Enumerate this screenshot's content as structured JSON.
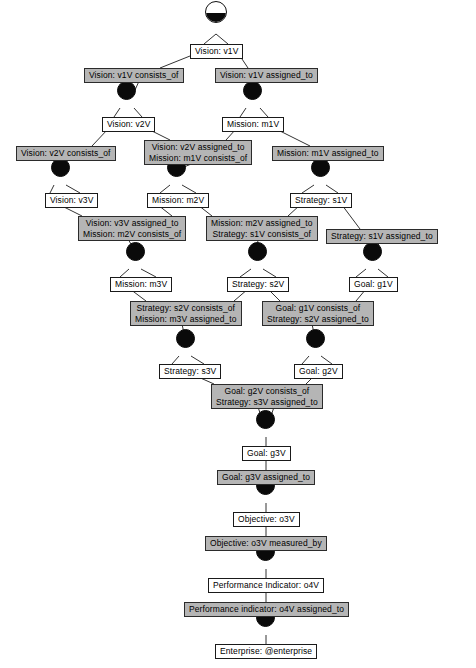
{
  "diagram": {
    "type": "tree",
    "colors": {
      "background": "#ffffff",
      "node_fill": "#0a0a0a",
      "node_label_fill": "#ffffff",
      "arc_label_fill": "#b5b5b5",
      "border": "#1a1a1a",
      "edge": "#333333"
    },
    "vertices": [
      {
        "id": "r0",
        "kind": "root",
        "x": 216,
        "y": 12,
        "d": 22
      },
      {
        "id": "v1",
        "kind": "filled",
        "x": 126,
        "y": 90,
        "d": 19
      },
      {
        "id": "v2",
        "kind": "filled",
        "x": 252,
        "y": 90,
        "d": 19
      },
      {
        "id": "v3",
        "kind": "filled",
        "x": 60,
        "y": 167,
        "d": 19
      },
      {
        "id": "v4",
        "kind": "filled",
        "x": 176,
        "y": 167,
        "d": 19
      },
      {
        "id": "v5",
        "kind": "filled",
        "x": 320,
        "y": 167,
        "d": 19
      },
      {
        "id": "v6",
        "kind": "filled",
        "x": 135,
        "y": 251,
        "d": 19
      },
      {
        "id": "v7",
        "kind": "filled",
        "x": 257,
        "y": 251,
        "d": 19
      },
      {
        "id": "v8",
        "kind": "filled",
        "x": 372,
        "y": 251,
        "d": 19
      },
      {
        "id": "v9",
        "kind": "filled",
        "x": 185,
        "y": 338,
        "d": 19
      },
      {
        "id": "v10",
        "kind": "filled",
        "x": 315,
        "y": 338,
        "d": 19
      },
      {
        "id": "v11",
        "kind": "filled",
        "x": 265,
        "y": 419,
        "d": 19
      },
      {
        "id": "v12",
        "kind": "filled",
        "x": 265,
        "y": 485,
        "d": 19
      },
      {
        "id": "v13",
        "kind": "filled",
        "x": 265,
        "y": 551,
        "d": 19
      },
      {
        "id": "v14",
        "kind": "filled",
        "x": 265,
        "y": 617,
        "d": 19
      }
    ],
    "labels": [
      {
        "id": "n-v1V",
        "kind": "node",
        "cx": 216,
        "y": 44,
        "lines": [
          "Vision: v1V"
        ]
      },
      {
        "id": "a-v1V-co",
        "kind": "arc",
        "cx": 134,
        "y": 68,
        "lines": [
          "Vision: v1V consists_of"
        ]
      },
      {
        "id": "a-v1V-as",
        "kind": "arc",
        "cx": 266,
        "y": 68,
        "lines": [
          "Vision: v1V assigned_to"
        ]
      },
      {
        "id": "n-v2V",
        "kind": "node",
        "cx": 128,
        "y": 117,
        "lines": [
          "Vision: v2V"
        ]
      },
      {
        "id": "n-m1V",
        "kind": "node",
        "cx": 253,
        "y": 117,
        "lines": [
          "Mission: m1V"
        ]
      },
      {
        "id": "a-v2V-co",
        "kind": "arc",
        "cx": 66,
        "y": 146,
        "lines": [
          "Vision: v2V consists_of"
        ]
      },
      {
        "id": "a-v2Vm1V",
        "kind": "arc",
        "cx": 198,
        "y": 140,
        "lines": [
          "Vision: v2V assigned_to",
          "Mission: m1V consists_of"
        ]
      },
      {
        "id": "a-m1V-as",
        "kind": "arc",
        "cx": 328,
        "y": 146,
        "lines": [
          "Mission: m1V assigned_to"
        ]
      },
      {
        "id": "n-v3V",
        "cx": 71,
        "kind": "node",
        "y": 193,
        "lines": [
          "Vision: v3V"
        ]
      },
      {
        "id": "n-m2V",
        "cx": 178,
        "kind": "node",
        "y": 193,
        "lines": [
          "Mission: m2V"
        ]
      },
      {
        "id": "n-s1V",
        "cx": 321,
        "kind": "node",
        "y": 193,
        "lines": [
          "Strategy: s1V"
        ]
      },
      {
        "id": "a-v3Vm2V",
        "kind": "arc",
        "cx": 132,
        "y": 216,
        "lines": [
          "Vision: v3V assigned_to",
          "Mission: m2V consists_of"
        ]
      },
      {
        "id": "a-m2Vs1V",
        "kind": "arc",
        "cx": 262,
        "y": 216,
        "lines": [
          "Mission: m2V assigned_to",
          "Strategy: s1V consists_of"
        ]
      },
      {
        "id": "a-s1V-as",
        "kind": "arc",
        "cx": 382,
        "y": 229,
        "lines": [
          "Strategy: s1V assigned_to"
        ]
      },
      {
        "id": "n-m3V",
        "kind": "node",
        "cx": 141,
        "y": 277,
        "lines": [
          "Mission: m3V"
        ]
      },
      {
        "id": "n-s2V",
        "kind": "node",
        "cx": 258,
        "y": 277,
        "lines": [
          "Strategy: s2V"
        ]
      },
      {
        "id": "n-g1V",
        "kind": "node",
        "cx": 373,
        "y": 277,
        "lines": [
          "Goal: g1V"
        ]
      },
      {
        "id": "a-s2Vm3V",
        "kind": "arc",
        "cx": 186,
        "y": 301,
        "lines": [
          "Strategy: s2V consists_of",
          "Mission: m3V assigned_to"
        ]
      },
      {
        "id": "a-g1Vs2V",
        "kind": "arc",
        "cx": 318,
        "y": 301,
        "lines": [
          "Goal: g1V consists_of",
          "Strategy: s2V assigned_to"
        ]
      },
      {
        "id": "n-s3V",
        "kind": "node",
        "cx": 190,
        "y": 364,
        "lines": [
          "Strategy: s3V"
        ]
      },
      {
        "id": "n-g2V",
        "kind": "node",
        "cx": 318,
        "y": 364,
        "lines": [
          "Goal: g2V"
        ]
      },
      {
        "id": "a-g2Vs3V",
        "kind": "arc",
        "cx": 267,
        "y": 384,
        "lines": [
          "Goal: g2V consists_of",
          "Strategy: s3V assigned_to"
        ]
      },
      {
        "id": "n-g3V",
        "kind": "node",
        "cx": 266,
        "y": 446,
        "lines": [
          "Goal: g3V"
        ]
      },
      {
        "id": "a-g3V-as",
        "kind": "arc",
        "cx": 266,
        "y": 470,
        "lines": [
          "Goal: g3V assigned_to"
        ]
      },
      {
        "id": "n-o3V",
        "kind": "node",
        "cx": 266,
        "y": 512,
        "lines": [
          "Objective: o3V"
        ]
      },
      {
        "id": "a-o3V-mb",
        "kind": "arc",
        "cx": 266,
        "y": 536,
        "lines": [
          "Objective: o3V measured_by"
        ]
      },
      {
        "id": "n-o4V",
        "kind": "node",
        "cx": 266,
        "y": 578,
        "lines": [
          "Performance Indicator: o4V"
        ]
      },
      {
        "id": "a-o4V-as",
        "kind": "arc",
        "cx": 266,
        "y": 602,
        "lines": [
          "Performance indicator: o4V assigned_to"
        ]
      },
      {
        "id": "n-ent",
        "kind": "node",
        "cx": 266,
        "y": 644,
        "lines": [
          "Enterprise: @enterprise"
        ]
      }
    ],
    "edges": [
      {
        "from": [
          216,
          34
        ],
        "to": [
          204,
          44
        ]
      },
      {
        "from": [
          216,
          34
        ],
        "to": [
          228,
          44
        ]
      },
      {
        "from": [
          190,
          56
        ],
        "to": [
          160,
          68
        ]
      },
      {
        "from": [
          240,
          56
        ],
        "to": [
          248,
          68
        ]
      },
      {
        "from": [
          140,
          79
        ],
        "to": [
          135,
          90
        ]
      },
      {
        "from": [
          258,
          79
        ],
        "to": [
          252,
          90
        ]
      },
      {
        "from": [
          120,
          108
        ],
        "to": [
          114,
          117
        ]
      },
      {
        "from": [
          134,
          108
        ],
        "to": [
          142,
          117
        ]
      },
      {
        "from": [
          246,
          108
        ],
        "to": [
          240,
          117
        ]
      },
      {
        "from": [
          260,
          108
        ],
        "to": [
          268,
          117
        ]
      },
      {
        "from": [
          108,
          129
        ],
        "to": [
          92,
          146
        ]
      },
      {
        "from": [
          148,
          129
        ],
        "to": [
          170,
          140
        ]
      },
      {
        "from": [
          236,
          129
        ],
        "to": [
          226,
          140
        ]
      },
      {
        "from": [
          276,
          129
        ],
        "to": [
          310,
          146
        ]
      },
      {
        "from": [
          66,
          157
        ],
        "to": [
          60,
          167
        ]
      },
      {
        "from": [
          196,
          162
        ],
        "to": [
          184,
          167
        ]
      },
      {
        "from": [
          330,
          157
        ],
        "to": [
          322,
          167
        ]
      },
      {
        "from": [
          54,
          185
        ],
        "to": [
          50,
          193
        ]
      },
      {
        "from": [
          66,
          185
        ],
        "to": [
          80,
          193
        ]
      },
      {
        "from": [
          170,
          185
        ],
        "to": [
          160,
          193
        ]
      },
      {
        "from": [
          182,
          185
        ],
        "to": [
          196,
          193
        ]
      },
      {
        "from": [
          314,
          185
        ],
        "to": [
          302,
          193
        ]
      },
      {
        "from": [
          326,
          185
        ],
        "to": [
          338,
          193
        ]
      },
      {
        "from": [
          60,
          205
        ],
        "to": [
          82,
          216
        ]
      },
      {
        "from": [
          158,
          205
        ],
        "to": [
          172,
          216
        ]
      },
      {
        "from": [
          198,
          205
        ],
        "to": [
          212,
          216
        ]
      },
      {
        "from": [
          300,
          205
        ],
        "to": [
          288,
          216
        ]
      },
      {
        "from": [
          342,
          205
        ],
        "to": [
          360,
          229
        ]
      },
      {
        "from": [
          128,
          239
        ],
        "to": [
          135,
          251
        ]
      },
      {
        "from": [
          258,
          239
        ],
        "to": [
          257,
          251
        ]
      },
      {
        "from": [
          382,
          241
        ],
        "to": [
          372,
          251
        ]
      },
      {
        "from": [
          129,
          269
        ],
        "to": [
          120,
          277
        ]
      },
      {
        "from": [
          141,
          269
        ],
        "to": [
          156,
          277
        ]
      },
      {
        "from": [
          251,
          269
        ],
        "to": [
          240,
          277
        ]
      },
      {
        "from": [
          263,
          269
        ],
        "to": [
          276,
          277
        ]
      },
      {
        "from": [
          366,
          269
        ],
        "to": [
          356,
          277
        ]
      },
      {
        "from": [
          378,
          269
        ],
        "to": [
          388,
          277
        ]
      },
      {
        "from": [
          130,
          289
        ],
        "to": [
          146,
          301
        ]
      },
      {
        "from": [
          248,
          289
        ],
        "to": [
          234,
          301
        ]
      },
      {
        "from": [
          268,
          289
        ],
        "to": [
          280,
          301
        ]
      },
      {
        "from": [
          366,
          289
        ],
        "to": [
          356,
          301
        ]
      },
      {
        "from": [
          182,
          324
        ],
        "to": [
          185,
          338
        ]
      },
      {
        "from": [
          312,
          324
        ],
        "to": [
          315,
          338
        ]
      },
      {
        "from": [
          179,
          356
        ],
        "to": [
          172,
          364
        ]
      },
      {
        "from": [
          191,
          356
        ],
        "to": [
          204,
          364
        ]
      },
      {
        "from": [
          309,
          356
        ],
        "to": [
          302,
          364
        ]
      },
      {
        "from": [
          321,
          356
        ],
        "to": [
          332,
          364
        ]
      },
      {
        "from": [
          196,
          376
        ],
        "to": [
          214,
          384
        ]
      },
      {
        "from": [
          314,
          376
        ],
        "to": [
          306,
          384
        ]
      },
      {
        "from": [
          258,
          407
        ],
        "to": [
          262,
          419
        ]
      },
      {
        "from": [
          274,
          407
        ],
        "to": [
          270,
          419
        ]
      },
      {
        "from": [
          266,
          437
        ],
        "to": [
          266,
          446
        ]
      },
      {
        "from": [
          266,
          458
        ],
        "to": [
          266,
          470
        ]
      },
      {
        "from": [
          266,
          482
        ],
        "to": [
          266,
          485
        ]
      },
      {
        "from": [
          266,
          503
        ],
        "to": [
          266,
          512
        ]
      },
      {
        "from": [
          266,
          524
        ],
        "to": [
          266,
          536
        ]
      },
      {
        "from": [
          266,
          548
        ],
        "to": [
          266,
          551
        ]
      },
      {
        "from": [
          266,
          569
        ],
        "to": [
          266,
          578
        ]
      },
      {
        "from": [
          266,
          590
        ],
        "to": [
          266,
          602
        ]
      },
      {
        "from": [
          266,
          614
        ],
        "to": [
          266,
          617
        ]
      },
      {
        "from": [
          266,
          635
        ],
        "to": [
          266,
          644
        ]
      }
    ]
  }
}
